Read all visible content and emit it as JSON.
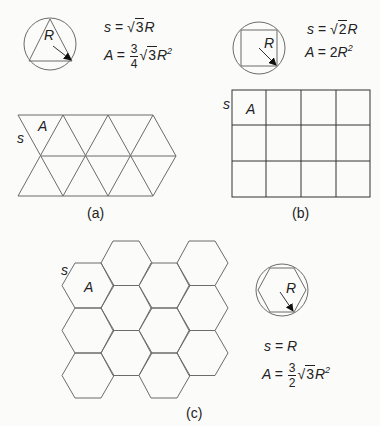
{
  "panels": {
    "a": {
      "caption": "(a)",
      "shape": "equilateral triangle",
      "inscribed_label": "R",
      "formula_s": {
        "lhs": "s",
        "eq": "=",
        "sqrt": "3",
        "rhs": "R"
      },
      "formula_A": {
        "lhs": "A",
        "eq": "=",
        "frac_num": "3",
        "frac_den": "4",
        "sqrt": "3",
        "rhs": "R",
        "exp": "2"
      },
      "tile_labels": {
        "side": "s",
        "area": "A"
      }
    },
    "b": {
      "caption": "(b)",
      "shape": "square",
      "inscribed_label": "R",
      "formula_s": {
        "lhs": "s",
        "eq": "=",
        "sqrt": "2",
        "rhs": "R"
      },
      "formula_A": {
        "lhs": "A",
        "eq": "=",
        "coef": "2",
        "rhs": "R",
        "exp": "2"
      },
      "tile_labels": {
        "side": "s",
        "area": "A"
      },
      "grid": {
        "rows": 3,
        "cols": 4
      }
    },
    "c": {
      "caption": "(c)",
      "shape": "regular hexagon",
      "inscribed_label": "R",
      "formula_s": {
        "lhs": "s",
        "eq": "=",
        "rhs": "R"
      },
      "formula_A": {
        "lhs": "A",
        "eq": "=",
        "frac_num": "3",
        "frac_den": "2",
        "sqrt": "3",
        "rhs": "R",
        "exp": "2"
      },
      "tile_labels": {
        "side": "s",
        "area": "A"
      },
      "grid": {
        "cols": 4,
        "hexes_per_col": 3
      }
    }
  },
  "colors": {
    "line": "#6b6b6b",
    "text": "#222222",
    "background": "#fbfbfa"
  }
}
